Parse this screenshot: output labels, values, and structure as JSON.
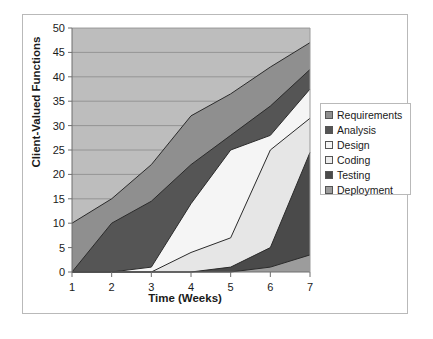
{
  "chart_data": {
    "type": "area",
    "stacked": true,
    "title": "",
    "xlabel": "Time (Weeks)",
    "ylabel": "Client-Valued Functions",
    "x": [
      1,
      2,
      3,
      4,
      5,
      6,
      7
    ],
    "xticklabels": [
      "1",
      "2",
      "3",
      "4",
      "5",
      "6",
      "7"
    ],
    "yticklabels": [
      "0",
      "5",
      "10",
      "15",
      "20",
      "25",
      "30",
      "35",
      "40",
      "45",
      "50"
    ],
    "yticks": [
      0,
      5,
      10,
      15,
      20,
      25,
      30,
      35,
      40,
      45,
      50
    ],
    "xlim": [
      1,
      7
    ],
    "ylim": [
      0,
      50
    ],
    "grid": "horizontal",
    "legend_position": "right",
    "plot_background": "#bdbdbd",
    "series": [
      {
        "name": "Deployment",
        "color": "#9c9c9c",
        "stack_order": 1,
        "values": [
          0,
          0,
          0,
          0,
          0,
          1,
          3.5
        ],
        "cumulative": [
          0,
          0,
          0,
          0,
          0,
          1,
          3.5
        ]
      },
      {
        "name": "Testing",
        "color": "#4a4a4a",
        "stack_order": 2,
        "values": [
          0,
          0,
          0,
          0,
          1,
          4,
          21
        ],
        "cumulative": [
          0,
          0,
          0,
          0,
          1,
          5,
          24.5
        ]
      },
      {
        "name": "Coding",
        "color": "#e6e6e6",
        "stack_order": 3,
        "values": [
          0,
          0,
          0,
          4,
          6,
          20,
          7
        ],
        "cumulative": [
          0,
          0,
          0,
          4,
          7,
          25,
          31.5
        ]
      },
      {
        "name": "Design",
        "color": "#f5f5f5",
        "stack_order": 4,
        "values": [
          0,
          0,
          1,
          10,
          18,
          3,
          6
        ],
        "cumulative": [
          0,
          0,
          1,
          14,
          25,
          28,
          37.5
        ]
      },
      {
        "name": "Analysis",
        "color": "#555555",
        "stack_order": 5,
        "values": [
          0,
          10,
          13.5,
          8,
          3,
          6,
          4
        ],
        "cumulative": [
          0,
          10,
          14.5,
          22,
          28,
          34,
          41.5
        ]
      },
      {
        "name": "Requirements",
        "color": "#8f8f8f",
        "stack_order": 6,
        "values": [
          10,
          5,
          7.5,
          10,
          8.5,
          8,
          5.5
        ],
        "cumulative": [
          10,
          15,
          22,
          32,
          36.5,
          42,
          47
        ]
      }
    ]
  },
  "legend": {
    "items": [
      {
        "label": "Requirements",
        "color": "#8f8f8f"
      },
      {
        "label": "Analysis",
        "color": "#555555"
      },
      {
        "label": "Design",
        "color": "#f5f5f5"
      },
      {
        "label": "Coding",
        "color": "#ededed"
      },
      {
        "label": "Testing",
        "color": "#4a4a4a"
      },
      {
        "label": "Deployment",
        "color": "#9c9c9c"
      }
    ]
  },
  "axes": {
    "y_title": "Client-Valued Functions",
    "x_title": "Time (Weeks)"
  }
}
